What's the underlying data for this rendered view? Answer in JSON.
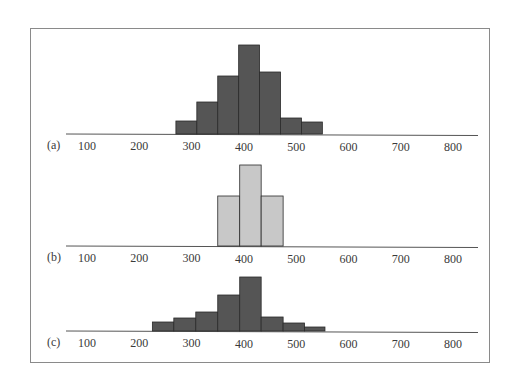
{
  "chart_data": [
    {
      "type": "bar",
      "panel_label": "(a)",
      "bar_color": "#555555",
      "x_ticks": [
        100,
        200,
        300,
        400,
        500,
        600,
        700,
        800
      ],
      "bin_edges": [
        270,
        310,
        350,
        390,
        430,
        470,
        510,
        550
      ],
      "values": [
        13,
        32,
        58,
        89,
        62,
        16,
        12
      ],
      "xlim": [
        60,
        850
      ],
      "baseline_y": 134,
      "title": "",
      "xlabel": "",
      "ylabel": ""
    },
    {
      "type": "bar",
      "panel_label": "(b)",
      "bar_color": "#c8c8c8",
      "x_ticks": [
        100,
        200,
        300,
        400,
        500,
        600,
        700,
        800
      ],
      "bin_edges": [
        350,
        392,
        433,
        475
      ],
      "values": [
        50,
        81,
        50
      ],
      "xlim": [
        60,
        850
      ],
      "baseline_y": 246,
      "title": "",
      "xlabel": "",
      "ylabel": ""
    },
    {
      "type": "bar",
      "panel_label": "(c)",
      "bar_color": "#555555",
      "x_ticks": [
        100,
        200,
        300,
        400,
        500,
        600,
        700,
        800
      ],
      "bin_edges": [
        225,
        266,
        308,
        350,
        392,
        433,
        475,
        516,
        555
      ],
      "values": [
        9,
        13,
        19,
        36,
        54,
        14,
        8,
        4
      ],
      "xlim": [
        60,
        850
      ],
      "baseline_y": 331,
      "title": "",
      "xlabel": "",
      "ylabel": ""
    }
  ],
  "frame": {
    "border_color": "#8a8a8a"
  }
}
